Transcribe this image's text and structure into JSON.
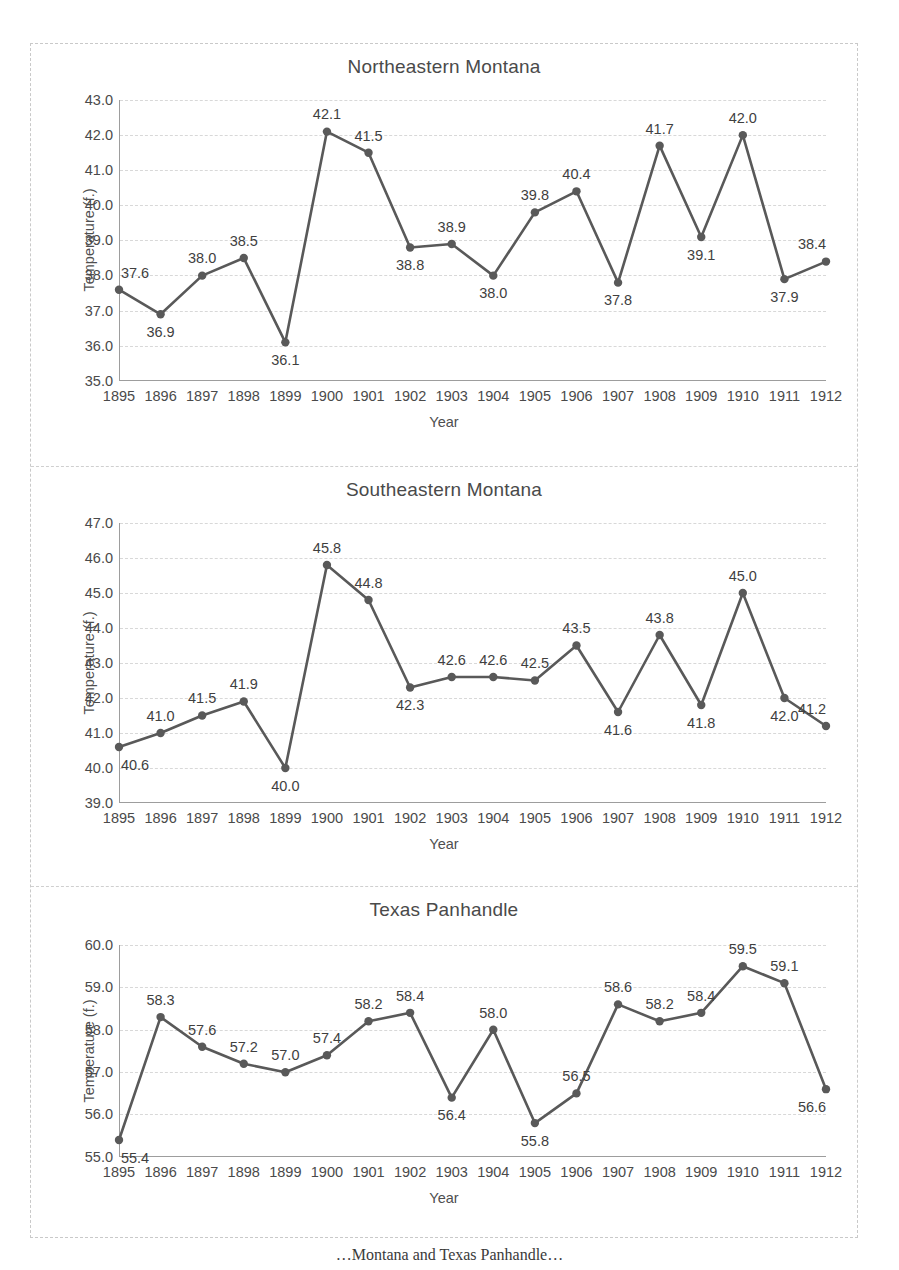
{
  "figure": {
    "caption": "…Montana and Texas Panhandle…",
    "line_color": "#595959",
    "marker_color": "#595959",
    "grid_color": "#d8d8d8",
    "axis_color": "#9d9d9d",
    "years": [
      "1895",
      "1896",
      "1897",
      "1898",
      "1899",
      "1900",
      "1901",
      "1902",
      "1903",
      "1904",
      "1905",
      "1906",
      "1907",
      "1908",
      "1909",
      "1910",
      "1911",
      "1912"
    ]
  },
  "chart_data": [
    {
      "type": "line",
      "title": "Northeastern Montana",
      "xlabel": "Year",
      "ylabel": "Temperature (f.)",
      "x": [
        1895,
        1896,
        1897,
        1898,
        1899,
        1900,
        1901,
        1902,
        1903,
        1904,
        1905,
        1906,
        1907,
        1908,
        1909,
        1910,
        1911,
        1912
      ],
      "categories": [
        "1895",
        "1896",
        "1897",
        "1898",
        "1899",
        "1900",
        "1901",
        "1902",
        "1903",
        "1904",
        "1905",
        "1906",
        "1907",
        "1908",
        "1909",
        "1910",
        "1911",
        "1912"
      ],
      "values": [
        37.6,
        36.9,
        38.0,
        38.5,
        36.1,
        42.1,
        41.5,
        38.8,
        38.9,
        38.0,
        39.8,
        40.4,
        37.8,
        41.7,
        39.1,
        42.0,
        37.9,
        38.4
      ],
      "point_labels": [
        "37.6",
        "36.9",
        "38.0",
        "38.5",
        "36.1",
        "42.1",
        "41.5",
        "38.8",
        "38.9",
        "38.0",
        "39.8",
        "40.4",
        "37.8",
        "41.7",
        "39.1",
        "42.0",
        "37.9",
        "38.4"
      ],
      "label_positions": [
        "above",
        "below",
        "above",
        "above",
        "below",
        "above",
        "above",
        "below",
        "above",
        "below",
        "above",
        "above",
        "below",
        "above",
        "below",
        "above",
        "below",
        "above"
      ],
      "ylim": [
        35.0,
        43.0
      ],
      "yticks": [
        "43.0",
        "42.0",
        "41.0",
        "40.0",
        "39.0",
        "38.0",
        "37.0",
        "36.0",
        "35.0"
      ],
      "ytick_values": [
        43.0,
        42.0,
        41.0,
        40.0,
        39.0,
        38.0,
        37.0,
        36.0,
        35.0
      ],
      "grid": true,
      "legend": "none"
    },
    {
      "type": "line",
      "title": "Southeastern Montana",
      "xlabel": "Year",
      "ylabel": "Temperature (f.)",
      "x": [
        1895,
        1896,
        1897,
        1898,
        1899,
        1900,
        1901,
        1902,
        1903,
        1904,
        1905,
        1906,
        1907,
        1908,
        1909,
        1910,
        1911,
        1912
      ],
      "categories": [
        "1895",
        "1896",
        "1897",
        "1898",
        "1899",
        "1900",
        "1901",
        "1902",
        "1903",
        "1904",
        "1905",
        "1906",
        "1907",
        "1908",
        "1909",
        "1910",
        "1911",
        "1912"
      ],
      "values": [
        40.6,
        41.0,
        41.5,
        41.9,
        40.0,
        45.8,
        44.8,
        42.3,
        42.6,
        42.6,
        42.5,
        43.5,
        41.6,
        43.8,
        41.8,
        45.0,
        42.0,
        41.2
      ],
      "point_labels": [
        "40.6",
        "41.0",
        "41.5",
        "41.9",
        "40.0",
        "45.8",
        "44.8",
        "42.3",
        "42.6",
        "42.6",
        "42.5",
        "43.5",
        "41.6",
        "43.8",
        "41.8",
        "45.0",
        "42.0",
        "41.2"
      ],
      "label_positions": [
        "below",
        "above",
        "above",
        "above",
        "below",
        "above",
        "above",
        "below",
        "above",
        "above",
        "above",
        "above",
        "below",
        "above",
        "below",
        "above",
        "below",
        "above"
      ],
      "ylim": [
        39.0,
        47.0
      ],
      "yticks": [
        "47.0",
        "46.0",
        "45.0",
        "44.0",
        "43.0",
        "42.0",
        "41.0",
        "40.0",
        "39.0"
      ],
      "ytick_values": [
        47.0,
        46.0,
        45.0,
        44.0,
        43.0,
        42.0,
        41.0,
        40.0,
        39.0
      ],
      "grid": true,
      "legend": "none"
    },
    {
      "type": "line",
      "title": "Texas Panhandle",
      "xlabel": "Year",
      "ylabel": "Temperature (f.)",
      "x": [
        1895,
        1896,
        1897,
        1898,
        1899,
        1900,
        1901,
        1902,
        1903,
        1904,
        1905,
        1906,
        1907,
        1908,
        1909,
        1910,
        1911,
        1912
      ],
      "categories": [
        "1895",
        "1896",
        "1897",
        "1898",
        "1899",
        "1900",
        "1901",
        "1902",
        "1903",
        "1904",
        "1905",
        "1906",
        "1907",
        "1908",
        "1909",
        "1910",
        "1911",
        "1912"
      ],
      "values": [
        55.4,
        58.3,
        57.6,
        57.2,
        57.0,
        57.4,
        58.2,
        58.4,
        56.4,
        58.0,
        55.8,
        56.5,
        58.6,
        58.2,
        58.4,
        59.5,
        59.1,
        56.6
      ],
      "point_labels": [
        "55.4",
        "58.3",
        "57.6",
        "57.2",
        "57.0",
        "57.4",
        "58.2",
        "58.4",
        "56.4",
        "58.0",
        "55.8",
        "56.5",
        "58.6",
        "58.2",
        "58.4",
        "59.5",
        "59.1",
        "56.6"
      ],
      "label_positions": [
        "below",
        "above",
        "above",
        "above",
        "above",
        "above",
        "above",
        "above",
        "below",
        "above",
        "below",
        "above",
        "above",
        "above",
        "above",
        "above",
        "above",
        "below"
      ],
      "ylim": [
        55.0,
        60.0
      ],
      "yticks": [
        "60.0",
        "59.0",
        "58.0",
        "57.0",
        "56.0",
        "55.0"
      ],
      "ytick_values": [
        60.0,
        59.0,
        58.0,
        57.0,
        56.0,
        55.0
      ],
      "grid": true,
      "legend": "none"
    }
  ]
}
